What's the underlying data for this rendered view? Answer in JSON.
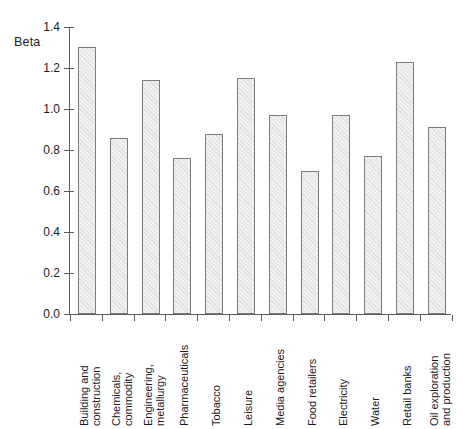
{
  "chart_data": {
    "type": "bar",
    "title": "",
    "subtitle": "",
    "xlabel": "",
    "ylabel": "Beta",
    "ylim": [
      0.0,
      1.4
    ],
    "ytick_labels": [
      "0.0",
      "0.2",
      "0.4",
      "0.6",
      "0.8",
      "1.0",
      "1.2",
      "1.4"
    ],
    "ytick_values": [
      0.0,
      0.2,
      0.4,
      0.6,
      0.8,
      1.0,
      1.2,
      1.4
    ],
    "grid": false,
    "legend": null,
    "categories": [
      "Building and construction",
      "Chemicals, commodity",
      "Engineering, metallurgy",
      "Pharmaceuticals",
      "Tobacco",
      "Leisure",
      "Media agencies",
      "Food retailers",
      "Electricity",
      "Water",
      "Retail banks",
      "Oil exploration and production"
    ],
    "category_lines": [
      [
        "Building and",
        "construction"
      ],
      [
        "Chemicals,",
        "commodity"
      ],
      [
        "Engineering,",
        "metallurgy"
      ],
      [
        "Pharmaceuticals"
      ],
      [
        "Tobacco"
      ],
      [
        "Leisure"
      ],
      [
        "Media agencies"
      ],
      [
        "Food retailers"
      ],
      [
        "Electricity"
      ],
      [
        "Water"
      ],
      [
        "Retail banks"
      ],
      [
        "Oil exploration",
        "and production"
      ]
    ],
    "values": [
      1.3,
      0.86,
      1.14,
      0.76,
      0.88,
      1.15,
      0.97,
      0.7,
      0.97,
      0.77,
      1.23,
      0.91
    ],
    "colors": {
      "bar_fill": "#f1f1f1",
      "bar_border": "#7c7c7c",
      "axis": "#5a5a5a",
      "text": "#1a1a1a",
      "background": "#ffffff"
    }
  }
}
